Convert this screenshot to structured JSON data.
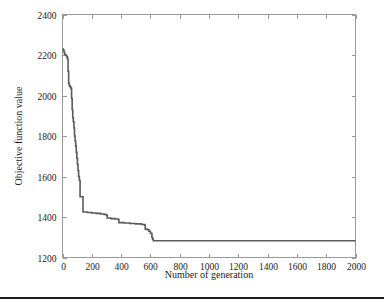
{
  "chart_data": {
    "type": "line",
    "title": "",
    "xlabel": "Number of generation",
    "ylabel": "Objective function value",
    "xlim": [
      0,
      2000
    ],
    "ylim": [
      1200,
      2400
    ],
    "xticks": [
      0,
      200,
      400,
      600,
      800,
      1000,
      1200,
      1400,
      1600,
      1800,
      2000
    ],
    "yticks": [
      1200,
      1400,
      1600,
      1800,
      2000,
      2200,
      2400
    ],
    "xtick_labels": [
      "0",
      "200",
      "400",
      "600",
      "800",
      "1000",
      "1200",
      "1400",
      "1600",
      "1800",
      "2000"
    ],
    "ytick_labels": [
      "1200",
      "1400",
      "1600",
      "1800",
      "2000",
      "2200",
      "2400"
    ],
    "grid": false,
    "legend": null,
    "legend_position": "none",
    "line_color": "#5a5a5a",
    "series": [
      {
        "name": "Best objective function value",
        "x": [
          0,
          5,
          10,
          14,
          18,
          22,
          26,
          30,
          34,
          38,
          42,
          46,
          50,
          54,
          58,
          62,
          66,
          70,
          74,
          78,
          82,
          86,
          90,
          94,
          98,
          102,
          106,
          110,
          115,
          120,
          140,
          170,
          200,
          230,
          260,
          285,
          300,
          305,
          330,
          360,
          380,
          385,
          420,
          460,
          500,
          540,
          560,
          565,
          580,
          590,
          600,
          610,
          615,
          620,
          700,
          800,
          900,
          1000,
          1100,
          1200,
          1300,
          1400,
          1500,
          1600,
          1700,
          1800,
          1900,
          2000
        ],
        "y": [
          2230,
          2225,
          2215,
          2205,
          2200,
          2200,
          2195,
          2190,
          2180,
          2120,
          2060,
          2050,
          2045,
          2040,
          2035,
          1985,
          1930,
          1890,
          1870,
          1840,
          1800,
          1775,
          1750,
          1720,
          1690,
          1660,
          1630,
          1600,
          1580,
          1500,
          1425,
          1422,
          1420,
          1418,
          1415,
          1412,
          1408,
          1395,
          1392,
          1390,
          1388,
          1372,
          1370,
          1368,
          1366,
          1363,
          1360,
          1340,
          1337,
          1330,
          1320,
          1300,
          1290,
          1283,
          1283,
          1283,
          1283,
          1283,
          1283,
          1283,
          1283,
          1283,
          1283,
          1283,
          1283,
          1283,
          1283,
          1283
        ]
      }
    ]
  },
  "figure": {
    "xlabel": "Number of generation",
    "ylabel": "Objective function value"
  }
}
